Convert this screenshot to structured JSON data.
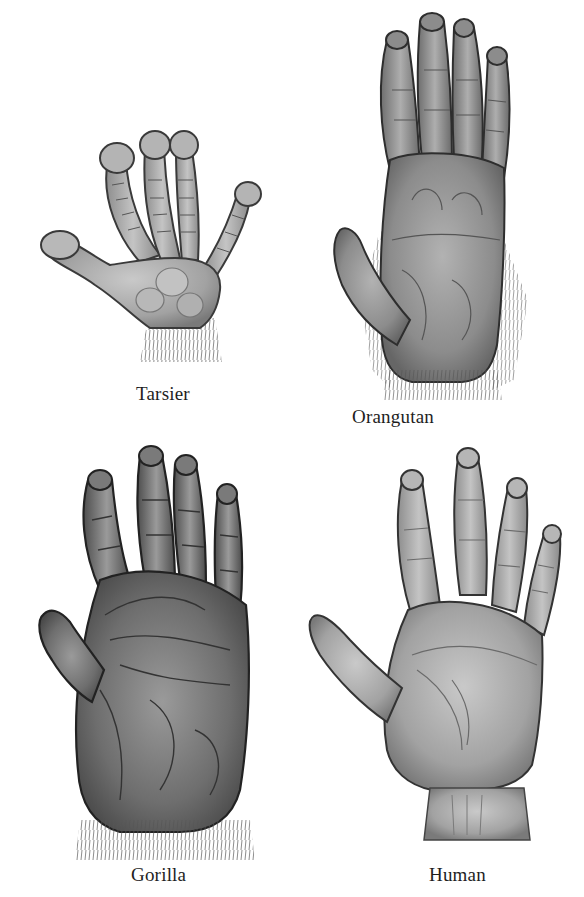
{
  "figure": {
    "background": "#ffffff",
    "panels": [
      {
        "id": "tarsier",
        "caption": "Tarsier",
        "tone": "#9a9a9a"
      },
      {
        "id": "orangutan",
        "caption": "Orangutan",
        "tone": "#8a8a8a"
      },
      {
        "id": "gorilla",
        "caption": "Gorilla",
        "tone": "#6f6f6f"
      },
      {
        "id": "human",
        "caption": "Human",
        "tone": "#a4a4a4"
      }
    ]
  }
}
